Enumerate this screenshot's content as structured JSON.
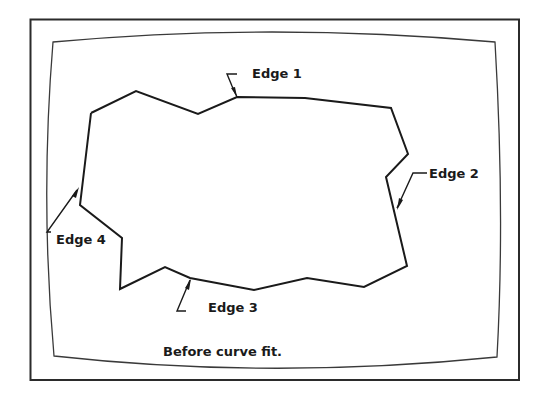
{
  "figure": {
    "caption": "Before curve fit.",
    "labels": {
      "edge1": "Edge 1",
      "edge2": "Edge 2",
      "edge3": "Edge 3",
      "edge4": "Edge 4"
    },
    "colors": {
      "line": "#1a1a1a",
      "background": "#ffffff"
    }
  }
}
